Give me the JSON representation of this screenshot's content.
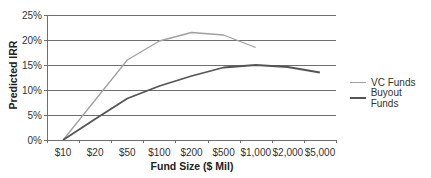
{
  "chart_data": {
    "type": "line",
    "title": "",
    "xlabel": "Fund Size ($ Mil)",
    "ylabel": "Predicted IRR",
    "categories": [
      "$10",
      "$20",
      "$50",
      "$100",
      "$200",
      "$500",
      "$1,000",
      "$2,000",
      "$5,000"
    ],
    "yticks": [
      "0%",
      "5%",
      "10%",
      "15%",
      "20%",
      "25%"
    ],
    "ylim": [
      0,
      25
    ],
    "grid": true,
    "legend_position": "right",
    "series": [
      {
        "name": "VC Funds",
        "color": "#a0a0a0",
        "width": 1.3,
        "values": [
          0,
          8.0,
          16.0,
          19.8,
          21.5,
          21.0,
          18.5,
          null,
          null
        ]
      },
      {
        "name": "Buyout Funds",
        "color": "#555555",
        "width": 1.8,
        "values": [
          0,
          4.2,
          8.3,
          10.8,
          12.8,
          14.5,
          15.0,
          14.6,
          13.5
        ]
      }
    ]
  },
  "colors": {
    "gridline": "#6e6e6e",
    "axis": "#6e6e6e"
  },
  "legend": {
    "items": [
      {
        "label": "VC Funds"
      },
      {
        "label": "Buyout Funds"
      }
    ]
  }
}
